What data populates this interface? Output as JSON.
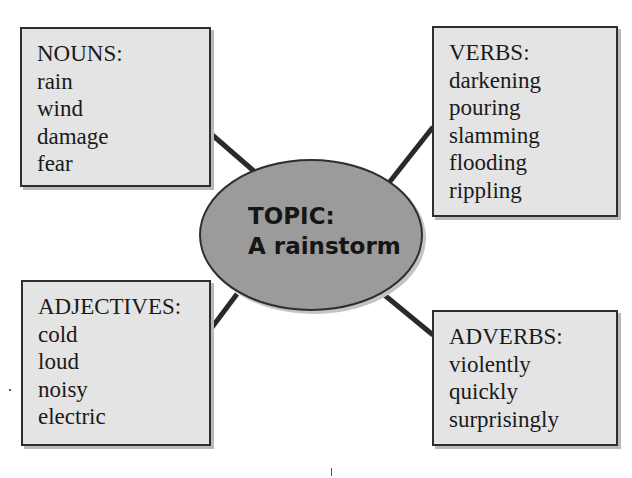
{
  "topic": {
    "label": "TOPIC:",
    "value": "A rainstorm",
    "fill_color": "#9b9b9b"
  },
  "boxes": {
    "nouns": {
      "label": "NOUNS:",
      "words": [
        "rain",
        "wind",
        "damage",
        "fear"
      ]
    },
    "verbs": {
      "label": "VERBS:",
      "words": [
        "darkening",
        "pouring",
        "slamming",
        "flooding",
        "rippling"
      ]
    },
    "adjectives": {
      "label": "ADJECTIVES:",
      "words": [
        "cold",
        "loud",
        "noisy",
        "electric"
      ]
    },
    "adverbs": {
      "label": "ADVERBS:",
      "words": [
        "violently",
        "quickly",
        "surprisingly"
      ]
    }
  },
  "style": {
    "box_fill": "#e4e4e4",
    "border_color": "#2e2e2e",
    "connector_color": "#2a2a2a"
  }
}
